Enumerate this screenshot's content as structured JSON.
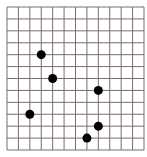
{
  "grid": {
    "columns": 12,
    "rows": 12,
    "left": 7,
    "top": 7,
    "right": 144,
    "bottom": 150,
    "line_color": "#7a6a72",
    "background": "#ffffff"
  },
  "points": {
    "color": "#000000",
    "radius": 4.5,
    "items": [
      {
        "col": 3,
        "row": 4
      },
      {
        "col": 4,
        "row": 6
      },
      {
        "col": 8,
        "row": 7
      },
      {
        "col": 2,
        "row": 9
      },
      {
        "col": 8,
        "row": 10
      },
      {
        "col": 7,
        "row": 11
      }
    ]
  }
}
